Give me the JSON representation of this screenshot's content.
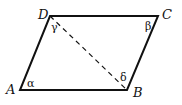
{
  "figure": {
    "type": "parallelogram",
    "vertices": {
      "A": "A",
      "B": "B",
      "C": "C",
      "D": "D"
    },
    "angles": {
      "alpha": "α",
      "beta": "β",
      "gamma": "γ",
      "delta": "δ"
    },
    "diagonal": "DB (dashed)"
  }
}
